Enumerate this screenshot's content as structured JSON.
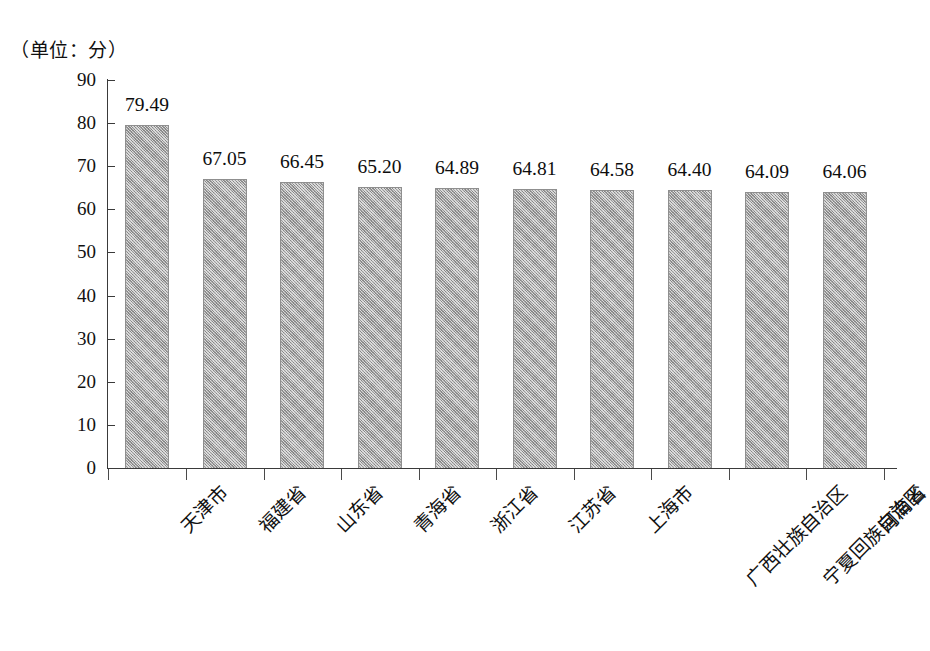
{
  "unit_caption": "（单位：分）",
  "chart_data": {
    "type": "bar",
    "title": "",
    "subtitle": "",
    "xlabel": "",
    "ylabel": "",
    "unit_note": "（单位：分）",
    "grid": false,
    "legend": false,
    "legend_position": "none",
    "ylim": [
      0,
      90
    ],
    "ytick_step": 10,
    "ytick_labels": [
      "90",
      "80",
      "70",
      "60",
      "50",
      "40",
      "30",
      "20",
      "10",
      "0"
    ],
    "ytick_values": [
      90,
      80,
      70,
      60,
      50,
      40,
      30,
      20,
      10,
      0
    ],
    "categories": [
      "天津市",
      "福建省",
      "山东省",
      "青海省",
      "浙江省",
      "江苏省",
      "上海市",
      "广西壮族自治区",
      "宁夏回族自治区",
      "河南省"
    ],
    "values": [
      79.49,
      67.05,
      66.45,
      65.2,
      64.89,
      64.81,
      64.58,
      64.4,
      64.09,
      64.06
    ],
    "value_labels": [
      "79.49",
      "67.05",
      "66.45",
      "65.20",
      "64.89",
      "64.81",
      "64.58",
      "64.40",
      "64.09",
      "64.06"
    ],
    "bar_color": "#a9a9a9",
    "bar_edge_color": "#8f8f8f",
    "axis_color": "#3a3a3a",
    "text_color": "#111111",
    "background_color": "#ffffff"
  }
}
